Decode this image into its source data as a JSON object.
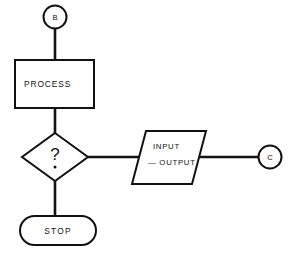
{
  "diagram": {
    "background_color": "#ffffff",
    "line_color": "#111111",
    "fill_color": "#ffffff",
    "nodes": [
      {
        "id": "connector-b",
        "shape": "circle",
        "role": "on-page-connector",
        "label": "B"
      },
      {
        "id": "process",
        "shape": "rectangle",
        "role": "process",
        "label": "PROCESS"
      },
      {
        "id": "decision",
        "shape": "diamond",
        "role": "decision",
        "label": "?"
      },
      {
        "id": "stop",
        "shape": "stadium",
        "role": "terminator",
        "label": "STOP"
      },
      {
        "id": "input-output",
        "shape": "parallelogram",
        "role": "input-output",
        "label_line_1": "INPUT",
        "label_line_2": "— OUTPUT"
      },
      {
        "id": "connector-c",
        "shape": "circle",
        "role": "on-page-connector",
        "label": "C"
      }
    ],
    "edges": [
      {
        "id": "edge-b-process",
        "from": "connector-b",
        "to": "process",
        "orientation": "vertical"
      },
      {
        "id": "edge-process-decision",
        "from": "process",
        "to": "decision",
        "orientation": "vertical"
      },
      {
        "id": "edge-decision-stop",
        "from": "decision",
        "to": "stop",
        "orientation": "vertical"
      },
      {
        "id": "edge-decision-io",
        "from": "decision",
        "to": "input-output",
        "orientation": "horizontal"
      },
      {
        "id": "edge-io-connector-c",
        "from": "input-output",
        "to": "connector-c",
        "orientation": "horizontal"
      }
    ]
  }
}
